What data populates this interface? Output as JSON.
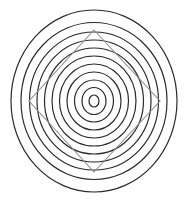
{
  "figure": {
    "type": "geometric-diagram",
    "canvas": {
      "width": 188,
      "height": 202,
      "background_color": "#ffffff"
    },
    "center": {
      "x": 94,
      "y": 101
    },
    "ring_color": "#2b2b2b",
    "ring_stroke_width": 1.2,
    "ring_count": 11,
    "rings": [
      {
        "index": 1,
        "rx": 5,
        "ry": 6,
        "label": "innermost-ring"
      },
      {
        "index": 2,
        "rx": 12,
        "ry": 13.5,
        "label": "ring-2"
      },
      {
        "index": 3,
        "rx": 19.5,
        "ry": 21,
        "label": "ring-3"
      },
      {
        "index": 4,
        "rx": 27,
        "ry": 29,
        "label": "ring-4"
      },
      {
        "index": 5,
        "rx": 34.5,
        "ry": 37,
        "label": "ring-5"
      },
      {
        "index": 6,
        "rx": 42,
        "ry": 45,
        "label": "ring-6"
      },
      {
        "index": 7,
        "rx": 49.5,
        "ry": 53,
        "label": "ring-7"
      },
      {
        "index": 8,
        "rx": 57,
        "ry": 61,
        "label": "ring-8"
      },
      {
        "index": 9,
        "rx": 64.5,
        "ry": 69,
        "label": "ring-9"
      },
      {
        "index": 10,
        "rx": 73,
        "ry": 78.5,
        "label": "ring-10"
      },
      {
        "index": 11,
        "rx": 83,
        "ry": 91,
        "label": "outermost-ring"
      }
    ],
    "diamond": {
      "label": "inscribed-diamond",
      "color": "#8f8f8f",
      "stroke_width": 1.1,
      "points": "94,30 160,101 94,172 29,101",
      "vertices": [
        {
          "name": "top",
          "x": 94,
          "y": 30
        },
        {
          "name": "right",
          "x": 160,
          "y": 101
        },
        {
          "name": "bottom",
          "x": 94,
          "y": 172
        },
        {
          "name": "left",
          "x": 29,
          "y": 101
        }
      ]
    }
  },
  "chart_data": {
    "type": "scatter",
    "xlabel": "",
    "ylabel": "",
    "categories": [
      "ring-1",
      "ring-2",
      "ring-3",
      "ring-4",
      "ring-5",
      "ring-6",
      "ring-7",
      "ring-8",
      "ring-9",
      "ring-10",
      "ring-11"
    ],
    "series": [
      {
        "name": "ring horizontal radius (px)",
        "values": [
          5,
          12,
          19.5,
          27,
          34.5,
          42,
          49.5,
          57,
          64.5,
          73,
          83
        ]
      },
      {
        "name": "ring vertical radius (px)",
        "values": [
          6,
          13.5,
          21,
          29,
          37,
          45,
          53,
          61,
          69,
          78.5,
          91
        ]
      }
    ],
    "annotations": [
      "gray diamond vertices at (94,30), (160,101), (94,172), (29,101)"
    ],
    "grid": false,
    "legend": "none"
  }
}
